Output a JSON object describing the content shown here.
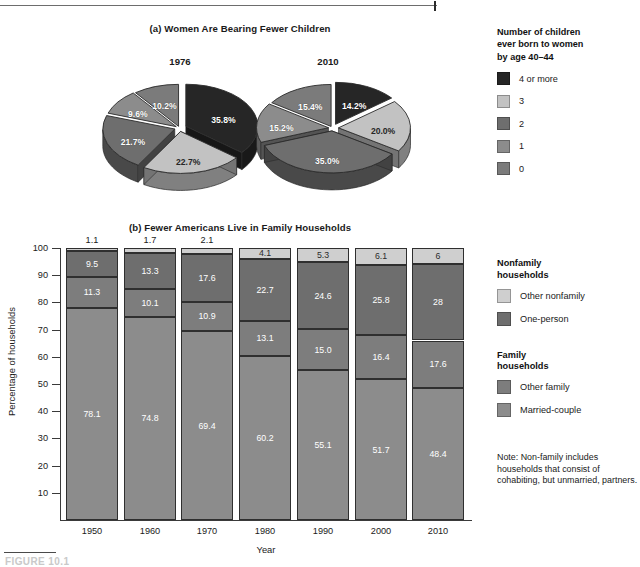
{
  "figure": {
    "caption": "FIGURE 10.1",
    "bottom_rule": true
  },
  "panel_a": {
    "title": "(a) Women Are Bearing Fewer Children",
    "legend": {
      "heading": "Number of children ever born to women by age 40–44",
      "heading_lines": [
        "Number of children",
        "ever born to women",
        "by age 40–44"
      ],
      "items": [
        {
          "label": "4 or more",
          "color": "#262626"
        },
        {
          "label": "3",
          "color": "#c2c2c2"
        },
        {
          "label": "2",
          "color": "#6e6e6e"
        },
        {
          "label": "1",
          "color": "#8c8c8c"
        },
        {
          "label": "0",
          "color": "#7b7b7b"
        }
      ]
    }
  },
  "panel_b": {
    "title": "(b) Fewer Americans Live in Family Households",
    "legend": {
      "group1_heading_lines": [
        "Nonfamily",
        "households"
      ],
      "group1_items": [
        {
          "label": "Other nonfamily",
          "color": "#cfcfcf"
        },
        {
          "label": "One-person",
          "color": "#6e6e6e"
        }
      ],
      "group2_heading_lines": [
        "Family",
        "households"
      ],
      "group2_items": [
        {
          "label": "Other family",
          "color": "#7d7d7d"
        },
        {
          "label": "Married-couple",
          "color": "#8c8c8c"
        }
      ]
    },
    "note": "Note: Non-family includes households that consist of cohabiting, but unmarried, partners."
  },
  "chart_data": [
    {
      "type": "pie",
      "title": "1976",
      "labels": [
        "4 or more",
        "3",
        "2",
        "1",
        "0"
      ],
      "values": [
        35.8,
        22.7,
        21.7,
        9.6,
        10.2
      ],
      "value_labels": [
        "35.8%",
        "22.7%",
        "21.7%",
        "9.6%",
        "10.2%"
      ],
      "colors": [
        "#262626",
        "#c2c2c2",
        "#6e6e6e",
        "#8c8c8c",
        "#7b7b7b"
      ],
      "exploded": true,
      "legend_position": "right"
    },
    {
      "type": "pie",
      "title": "2010",
      "labels": [
        "4 or more",
        "3",
        "2",
        "1",
        "0"
      ],
      "values": [
        14.2,
        20.0,
        35.0,
        15.2,
        15.4
      ],
      "value_labels": [
        "14.2%",
        "20.0%",
        "35.0%",
        "15.2%",
        "15.4%"
      ],
      "colors": [
        "#262626",
        "#c2c2c2",
        "#6e6e6e",
        "#8c8c8c",
        "#7b7b7b"
      ],
      "exploded": true,
      "legend_position": "right"
    },
    {
      "type": "bar",
      "subtype": "stacked-column",
      "title": "(b) Fewer Americans Live in Family Households",
      "xlabel": "Year",
      "ylabel": "Percentage of households",
      "ylim": [
        0,
        100
      ],
      "yticks": [
        10,
        20,
        30,
        40,
        50,
        60,
        70,
        80,
        90,
        100
      ],
      "grid": false,
      "legend_position": "right",
      "categories": [
        "1950",
        "1960",
        "1970",
        "1980",
        "1990",
        "2000",
        "2010"
      ],
      "series": [
        {
          "name": "Married-couple",
          "color": "#8c8c8c",
          "values": [
            78.1,
            74.8,
            69.4,
            60.2,
            55.1,
            51.7,
            48.4
          ],
          "labels": [
            "78.1",
            "74.8",
            "69.4",
            "60.2",
            "55.1",
            "51.7",
            "48.4"
          ]
        },
        {
          "name": "Other family",
          "color": "#7d7d7d",
          "values": [
            11.3,
            10.1,
            10.9,
            13.1,
            15.0,
            16.4,
            17.6
          ],
          "labels": [
            "11.3",
            "10.1",
            "10.9",
            "13.1",
            "15.0",
            "16.4",
            "17.6"
          ]
        },
        {
          "name": "One-person",
          "color": "#6e6e6e",
          "values": [
            9.5,
            13.3,
            17.6,
            22.7,
            24.6,
            25.8,
            28
          ],
          "labels": [
            "9.5",
            "13.3",
            "17.6",
            "22.7",
            "24.6",
            "25.8",
            "28"
          ]
        },
        {
          "name": "Other nonfamily",
          "color": "#cfcfcf",
          "values": [
            1.1,
            1.7,
            2.1,
            4.1,
            5.3,
            6.1,
            6
          ],
          "labels": [
            "1.1",
            "1.7",
            "2.1",
            "4.1",
            "5.3",
            "6.1",
            "6"
          ]
        }
      ]
    }
  ]
}
